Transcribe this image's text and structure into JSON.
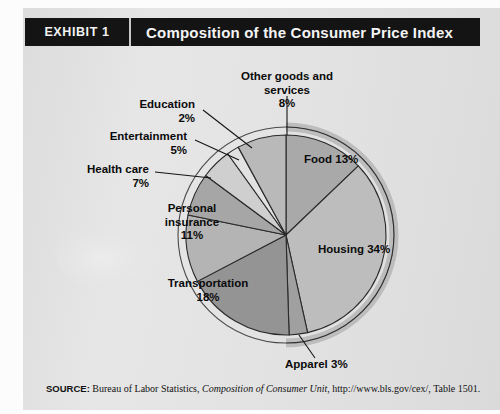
{
  "header": {
    "exhibit_label": "EXHIBIT 1",
    "title": "Composition of the Consumer Price Index"
  },
  "source": {
    "prefix": "SOURCE:",
    "text_before": " Bureau of Labor Statistics, ",
    "italic": "Composition of Consumer Unit",
    "text_after": ", http://www.bls.gov/cex/, Table 1501."
  },
  "labels": {
    "food": "Food  13%",
    "housing": "Housing  34%",
    "apparel": "Apparel  3%",
    "transportation_name": "Transportation",
    "transportation_pct": "18%",
    "personal_insurance_l1": "Personal",
    "personal_insurance_l2": "insurance",
    "personal_insurance_pct": "11%",
    "health_care_name": "Health care",
    "health_care_pct": "7%",
    "entertainment_name": "Entertainment",
    "entertainment_pct": "5%",
    "education_name": "Education",
    "education_pct": "2%",
    "other_l1": "Other goods and",
    "other_l2": "services",
    "other_pct": "8%"
  },
  "chart_data": {
    "type": "pie",
    "title": "Composition of the Consumer Price Index",
    "categories": [
      "Food",
      "Housing",
      "Apparel",
      "Transportation",
      "Personal insurance",
      "Health care",
      "Entertainment",
      "Education",
      "Other goods and services"
    ],
    "values": [
      13,
      34,
      3,
      18,
      11,
      7,
      5,
      2,
      8
    ],
    "unit": "percent",
    "total": 101,
    "start_angle_deg": 0,
    "direction": "clockwise",
    "legend": "none (direct labels with leader lines)",
    "slice_colors": [
      "#a9a9a9",
      "#bdbdbd",
      "#a0a0a0",
      "#949494",
      "#b4b4b4",
      "#a6a6a6",
      "#cfcfcf",
      "#e2e2e2",
      "#b9b9b9"
    ],
    "outline_color": "#2a2a2a",
    "background": "#e2e2e2"
  }
}
